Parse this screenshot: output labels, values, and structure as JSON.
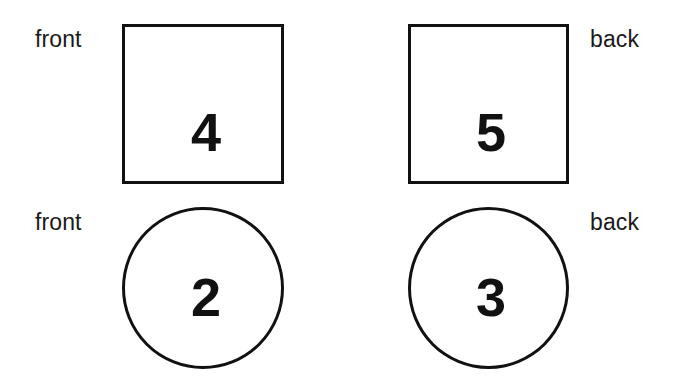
{
  "canvas": {
    "width": 681,
    "height": 386,
    "background_color": "#ffffff",
    "stroke_color": "#111111",
    "text_color": "#1a1a1a"
  },
  "labels": {
    "row1_left": "front",
    "row1_right": "back",
    "row2_left": "front",
    "row2_right": "back"
  },
  "shapes": {
    "square_front": {
      "kind": "square",
      "value": "4",
      "side_label": "front",
      "side": "left"
    },
    "square_back": {
      "kind": "square",
      "value": "5",
      "side_label": "back",
      "side": "right"
    },
    "circle_front": {
      "kind": "circle",
      "value": "2",
      "side_label": "front",
      "side": "left"
    },
    "circle_back": {
      "kind": "circle",
      "value": "3",
      "side_label": "back",
      "side": "right"
    }
  }
}
